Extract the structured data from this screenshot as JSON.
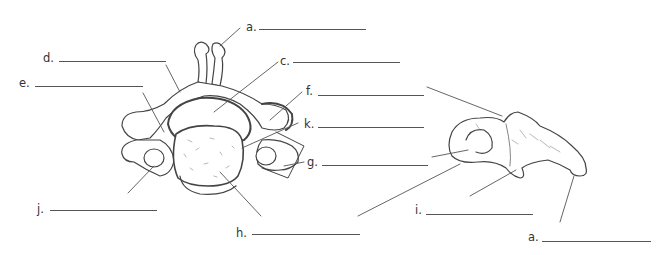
{
  "diagram": {
    "colors": {
      "line": "#555555",
      "text": "#333333",
      "bone_fill": "#ffffff",
      "body_texture": "#888888"
    },
    "labels": [
      {
        "id": "a-top",
        "text": "a."
      },
      {
        "id": "c",
        "text": "c."
      },
      {
        "id": "d",
        "text": "d."
      },
      {
        "id": "e",
        "text": "e."
      },
      {
        "id": "f",
        "text": "f."
      },
      {
        "id": "k",
        "text": "k."
      },
      {
        "id": "g",
        "text": "g."
      },
      {
        "id": "j",
        "text": "j."
      },
      {
        "id": "h",
        "text": "h."
      },
      {
        "id": "i",
        "text": "i."
      },
      {
        "id": "a-bottom",
        "text": "a."
      }
    ]
  }
}
